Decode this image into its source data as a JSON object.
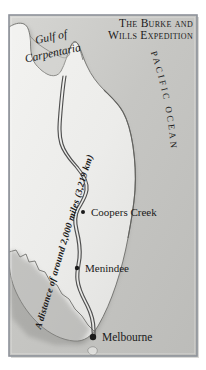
{
  "figure": {
    "kind": "historical-route-map",
    "title_line1": "The Burke and",
    "title_line2": "Wills Expedition",
    "frame_color": "#8d9199",
    "land_color": "#e9e9e7",
    "ocean_color": "#c9c9c6",
    "route_color": "#5b5b5b",
    "label_color": "#1a1a1a"
  },
  "water_labels": {
    "gulf_line1": "Gulf of",
    "gulf_line2": "Carpentaria",
    "ocean": "PACIFIC OCEAN",
    "ocean_letters": [
      "P",
      "A",
      "C",
      "I",
      "F",
      "I",
      "C",
      " ",
      "O",
      "C",
      "E",
      "A",
      "N"
    ]
  },
  "route": {
    "annotation": "A distance of around 2,000 miles (3,219 km)",
    "distance_miles": "2,000 miles",
    "distance_km": "3,219 km"
  },
  "places": [
    {
      "name": "Coopers Creek",
      "marker": "small",
      "x": 83,
      "y": 212
    },
    {
      "name": "Menindee",
      "marker": "small",
      "x": 77,
      "y": 268
    },
    {
      "name": "Melbourne",
      "marker": "large",
      "x": 93,
      "y": 337
    }
  ]
}
